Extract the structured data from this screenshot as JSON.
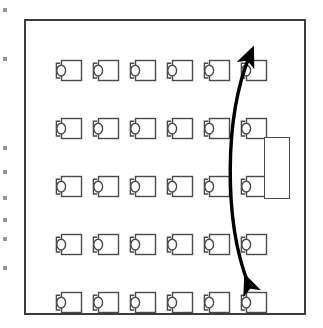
{
  "diagram": {
    "room": {
      "name": "room-outline",
      "border_color": "#3c3c3c"
    },
    "seating": {
      "row_count": 5,
      "seats_per_row": 6,
      "total_seats": 30,
      "unit_icon": "desk-chair-icon",
      "unit_color": "#4a4a4a",
      "row_tops": [
        36,
        94,
        152,
        210,
        268
      ],
      "column_lefts": [
        27,
        64,
        101,
        138,
        175,
        212
      ],
      "rows": [
        {
          "label": "row-1",
          "seats": [
            "seat-1-1",
            "seat-1-2",
            "seat-1-3",
            "seat-1-4",
            "seat-1-5",
            "seat-1-6"
          ]
        },
        {
          "label": "row-2",
          "seats": [
            "seat-2-1",
            "seat-2-2",
            "seat-2-3",
            "seat-2-4",
            "seat-2-5",
            "seat-2-6"
          ]
        },
        {
          "label": "row-3",
          "seats": [
            "seat-3-1",
            "seat-3-2",
            "seat-3-3",
            "seat-3-4",
            "seat-3-5",
            "seat-3-6"
          ]
        },
        {
          "label": "row-4",
          "seats": [
            "seat-4-1",
            "seat-4-2",
            "seat-4-3",
            "seat-4-4",
            "seat-4-5",
            "seat-4-6"
          ]
        },
        {
          "label": "row-5",
          "seats": [
            "seat-5-1",
            "seat-5-2",
            "seat-5-3",
            "seat-5-4",
            "seat-5-5",
            "seat-5-6"
          ]
        }
      ]
    },
    "lectern": {
      "name": "lectern",
      "left": 238,
      "top": 116,
      "width": 26,
      "height": 62,
      "border_color": "#4a4a4a"
    },
    "arrow": {
      "name": "double-headed-curved-arrow",
      "color": "#000000",
      "double_headed": true,
      "path": "M 224 34 C 198 96, 198 200, 222 262"
    },
    "edge_artifacts": {
      "name": "page-edge-fragments",
      "tops": [
        8,
        57,
        146,
        170,
        196,
        218,
        237,
        266
      ]
    }
  }
}
